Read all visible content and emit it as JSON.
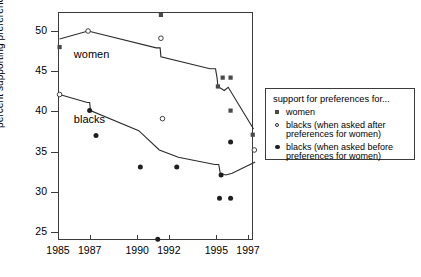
{
  "chart_data": {
    "type": "scatter",
    "title": "",
    "xlabel": "",
    "ylabel": "percent supporting preferences",
    "xlim": [
      1984.3,
      1998.2
    ],
    "ylim": [
      23.0,
      52.8
    ],
    "grid": false,
    "xticks": [
      1985,
      1987,
      1990,
      1992,
      1995,
      1997
    ],
    "xtick_labels": [
      "1985",
      "1987",
      "1990",
      "1992",
      "1995",
      "1997"
    ],
    "yticks": [
      25,
      30,
      35,
      40,
      45,
      50
    ],
    "ytick_labels": [
      "25",
      "30",
      "35",
      "40",
      "45",
      "50"
    ],
    "annotations": [
      {
        "text": "women",
        "x": 1986.0,
        "y": 47.0
      },
      {
        "text": "blacks",
        "x": 1986.0,
        "y": 38.9
      }
    ],
    "legend": {
      "position": "right",
      "title": "support for preferences for...",
      "entries": [
        {
          "marker": "filled-square",
          "label": "women"
        },
        {
          "marker": "open-circle",
          "label": "blacks (when asked after\npreferences for women)"
        },
        {
          "marker": "filled-circle",
          "label": "blacks (when asked before\npreferences for women)"
        }
      ]
    },
    "series": [
      {
        "name": "women",
        "marker": "filled-square",
        "points": [
          {
            "x": 1985.1,
            "y": 48.0
          },
          {
            "x": 1991.5,
            "y": 52.0
          },
          {
            "x": 1995.1,
            "y": 43.1
          },
          {
            "x": 1995.4,
            "y": 44.2
          },
          {
            "x": 1995.9,
            "y": 44.2
          },
          {
            "x": 1995.9,
            "y": 40.1
          },
          {
            "x": 1997.3,
            "y": 37.1
          }
        ]
      },
      {
        "name": "blacks (when asked after preferences for women)",
        "marker": "open-circle",
        "points": [
          {
            "x": 1985.1,
            "y": 42.1
          },
          {
            "x": 1986.9,
            "y": 50.0
          },
          {
            "x": 1991.5,
            "y": 49.1
          },
          {
            "x": 1991.6,
            "y": 39.1
          },
          {
            "x": 1997.4,
            "y": 35.2
          }
        ]
      },
      {
        "name": "blacks (when asked before preferences for women)",
        "marker": "filled-circle",
        "points": [
          {
            "x": 1987.0,
            "y": 40.1
          },
          {
            "x": 1987.4,
            "y": 37.0
          },
          {
            "x": 1990.2,
            "y": 33.1
          },
          {
            "x": 1991.3,
            "y": 24.1
          },
          {
            "x": 1992.5,
            "y": 33.1
          },
          {
            "x": 1995.2,
            "y": 29.2
          },
          {
            "x": 1995.3,
            "y": 32.1
          },
          {
            "x": 1995.9,
            "y": 29.2
          },
          {
            "x": 1995.9,
            "y": 36.2
          }
        ]
      }
    ],
    "trend_lines": [
      {
        "name": "women-trend",
        "points": [
          [
            1985.1,
            49.0
          ],
          [
            1986.9,
            50.0
          ],
          [
            1991.2,
            47.9
          ],
          [
            1991.45,
            47.9
          ],
          [
            1991.5,
            46.8
          ],
          [
            1994.6,
            45.3
          ],
          [
            1994.95,
            45.3
          ],
          [
            1995.05,
            44.1
          ],
          [
            1995.1,
            43.1
          ],
          [
            1995.5,
            42.6
          ],
          [
            1995.75,
            43.0
          ],
          [
            1997.35,
            37.8
          ]
        ]
      },
      {
        "name": "blacks-trend",
        "points": [
          [
            1985.1,
            42.1
          ],
          [
            1986.85,
            41.1
          ],
          [
            1987.0,
            41.1
          ],
          [
            1987.05,
            40.1
          ],
          [
            1990.1,
            37.6
          ],
          [
            1991.4,
            35.2
          ],
          [
            1992.6,
            34.3
          ],
          [
            1994.9,
            33.4
          ],
          [
            1995.15,
            33.4
          ],
          [
            1995.25,
            32.3
          ],
          [
            1995.6,
            32.1
          ],
          [
            1996.0,
            32.3
          ],
          [
            1997.45,
            33.7
          ]
        ]
      }
    ]
  }
}
